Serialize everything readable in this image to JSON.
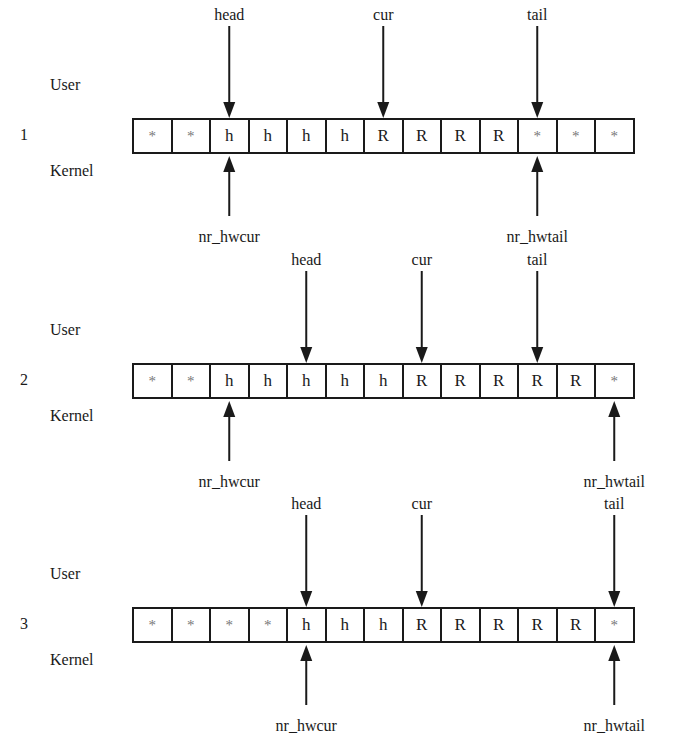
{
  "side_labels": {
    "user": "User",
    "kernel": "Kernel"
  },
  "rows": [
    {
      "number": "1",
      "cells": [
        "*",
        "*",
        "h",
        "h",
        "h",
        "h",
        "R",
        "R",
        "R",
        "R",
        "*",
        "*",
        "*"
      ],
      "top_pointers": [
        {
          "label": "head",
          "index": 2
        },
        {
          "label": "cur",
          "index": 6
        },
        {
          "label": "tail",
          "index": 10
        }
      ],
      "bottom_pointers": [
        {
          "label": "nr_hwcur",
          "index": 2
        },
        {
          "label": "nr_hwtail",
          "index": 10
        }
      ]
    },
    {
      "number": "2",
      "cells": [
        "*",
        "*",
        "h",
        "h",
        "h",
        "h",
        "h",
        "R",
        "R",
        "R",
        "R",
        "R",
        "*"
      ],
      "top_pointers": [
        {
          "label": "head",
          "index": 4
        },
        {
          "label": "cur",
          "index": 7
        },
        {
          "label": "tail",
          "index": 10
        }
      ],
      "bottom_pointers": [
        {
          "label": "nr_hwcur",
          "index": 2
        },
        {
          "label": "nr_hwtail",
          "index": 12
        }
      ]
    },
    {
      "number": "3",
      "cells": [
        "*",
        "*",
        "*",
        "*",
        "h",
        "h",
        "h",
        "R",
        "R",
        "R",
        "R",
        "R",
        "*"
      ],
      "top_pointers": [
        {
          "label": "head",
          "index": 4
        },
        {
          "label": "cur",
          "index": 7
        },
        {
          "label": "tail",
          "index": 12
        }
      ],
      "bottom_pointers": [
        {
          "label": "nr_hwcur",
          "index": 4
        },
        {
          "label": "nr_hwtail",
          "index": 12
        }
      ]
    }
  ]
}
